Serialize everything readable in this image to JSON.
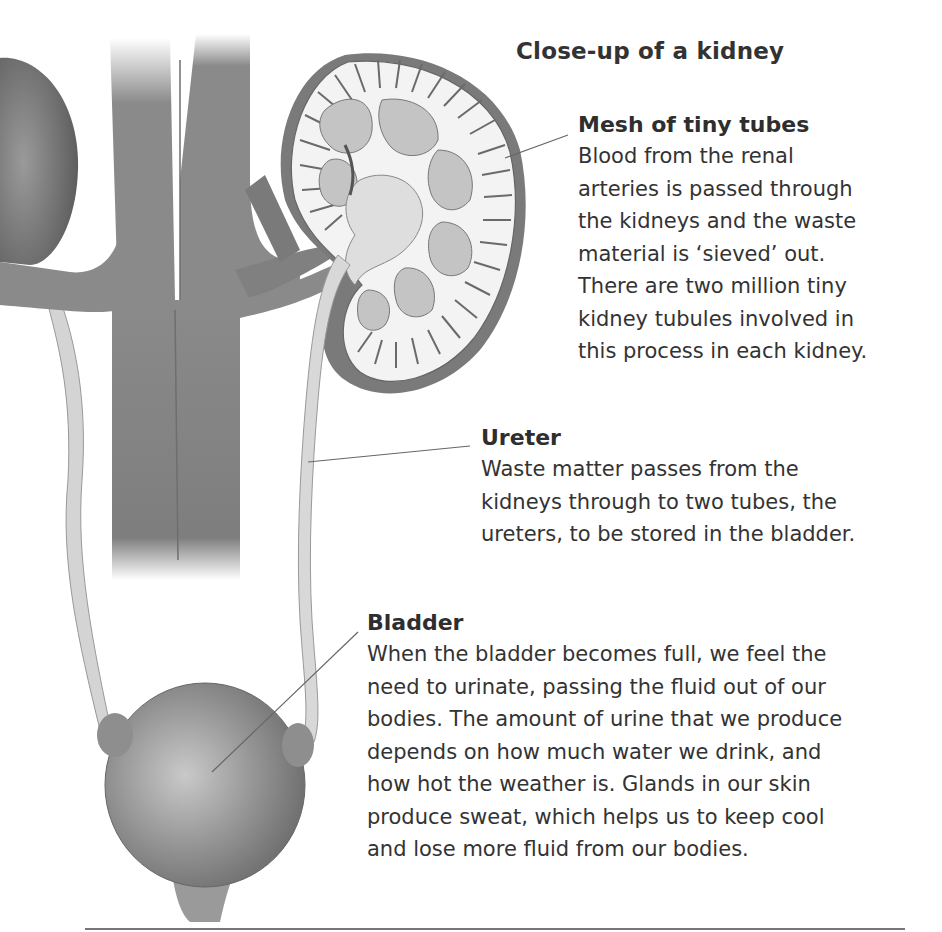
{
  "diagram": {
    "title": "Close-up of a kidney",
    "labels": [
      {
        "heading": "Mesh of tiny tubes",
        "lines": [
          "Blood from the renal",
          "arteries is passed through",
          "the kidneys and the waste",
          "material is ‘sieved’ out.",
          "There are two million tiny",
          "kidney tubules involved in",
          "this process in each kidney."
        ]
      },
      {
        "heading": "Ureter",
        "lines": [
          "Waste matter passes from the",
          "kidneys through to two tubes, the",
          "ureters, to be stored in the bladder."
        ]
      },
      {
        "heading": "Bladder",
        "lines": [
          "When the bladder becomes full, we feel the",
          "need to urinate, passing the fluid out of our",
          "bodies. The amount of urine that we produce",
          "depends on how much water we drink, and",
          "how hot the weather is. Glands in our skin",
          "produce sweat, which helps us to keep cool",
          "and lose more fluid from our bodies."
        ]
      }
    ],
    "colors": {
      "vessel": "#8a8a8a",
      "vessel_dark": "#6e6e6e",
      "ureter_tube": "#d8d8d8",
      "kidney_cortex": "#f2f2f2",
      "leader_line": "#666666"
    }
  }
}
